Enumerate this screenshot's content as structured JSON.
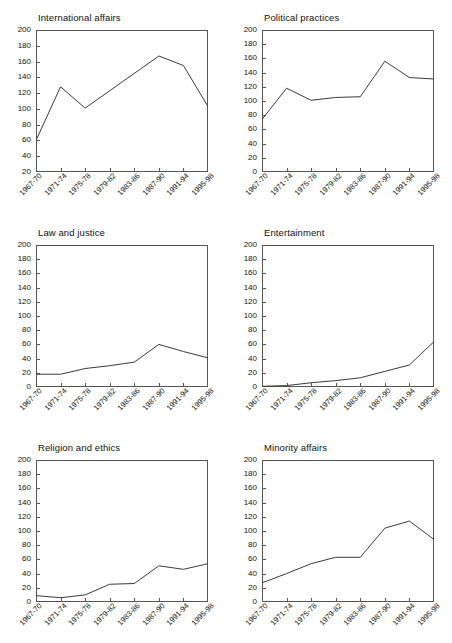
{
  "figure": {
    "panel_count": 6,
    "categories": [
      "1967-70",
      "1971-74",
      "1975-78",
      "1979-82",
      "1983-86",
      "1987-90",
      "1991-94",
      "1995-98"
    ],
    "line_color": "#3a3a3a",
    "axis_color": "#555555",
    "background": "#ffffff"
  },
  "chart_data": [
    {
      "type": "line",
      "title": "International affairs",
      "xlabel": "",
      "ylabel": "",
      "categories": [
        "1967-70",
        "1971-74",
        "1975-78",
        "1979-82",
        "1983-86",
        "1987-90",
        "1991-94",
        "1995-98"
      ],
      "values": [
        60,
        128,
        101,
        123,
        145,
        167,
        155,
        103
      ],
      "ylim": [
        20,
        200
      ],
      "yticks": [
        20,
        40,
        60,
        80,
        100,
        120,
        140,
        160,
        180,
        200
      ],
      "grid": false,
      "legend": "none"
    },
    {
      "type": "line",
      "title": "Political practices",
      "xlabel": "",
      "ylabel": "",
      "categories": [
        "1967-70",
        "1971-74",
        "1975-78",
        "1979-82",
        "1983-86",
        "1987-90",
        "1991-94",
        "1995-98"
      ],
      "values": [
        74,
        118,
        101,
        105,
        106,
        156,
        133,
        131
      ],
      "ylim": [
        0,
        200
      ],
      "yticks": [
        0,
        20,
        40,
        60,
        80,
        100,
        120,
        140,
        160,
        180,
        200
      ],
      "grid": false,
      "legend": "none"
    },
    {
      "type": "line",
      "title": "Law and justice",
      "xlabel": "",
      "ylabel": "",
      "categories": [
        "1967-70",
        "1971-74",
        "1975-78",
        "1979-82",
        "1983-86",
        "1987-90",
        "1991-94",
        "1995-98"
      ],
      "values": [
        18,
        18,
        26,
        30,
        35,
        60,
        50,
        41
      ],
      "ylim": [
        0,
        200
      ],
      "yticks": [
        0,
        20,
        40,
        60,
        80,
        100,
        120,
        140,
        160,
        180,
        200
      ],
      "grid": false,
      "legend": "none"
    },
    {
      "type": "line",
      "title": "Entertainment",
      "xlabel": "",
      "ylabel": "",
      "categories": [
        "1967-70",
        "1971-74",
        "1975-78",
        "1979-82",
        "1983-86",
        "1987-90",
        "1991-94",
        "1995-98"
      ],
      "values": [
        1,
        2,
        6,
        9,
        13,
        22,
        31,
        64
      ],
      "ylim": [
        0,
        200
      ],
      "yticks": [
        0,
        20,
        40,
        60,
        80,
        100,
        120,
        140,
        160,
        180,
        200
      ],
      "grid": false,
      "legend": "none"
    },
    {
      "type": "line",
      "title": "Religion and ethics",
      "xlabel": "",
      "ylabel": "",
      "categories": [
        "1967-70",
        "1971-74",
        "1975-78",
        "1979-82",
        "1983-86",
        "1987-90",
        "1991-94",
        "1995-98"
      ],
      "values": [
        9,
        6,
        10,
        25,
        26,
        51,
        46,
        54
      ],
      "ylim": [
        0,
        200
      ],
      "yticks": [
        0,
        20,
        40,
        60,
        80,
        100,
        120,
        140,
        160,
        180,
        200
      ],
      "grid": false,
      "legend": "none"
    },
    {
      "type": "line",
      "title": "Minority affairs",
      "xlabel": "",
      "ylabel": "",
      "categories": [
        "1967-70",
        "1971-74",
        "1975-78",
        "1979-82",
        "1983-86",
        "1987-90",
        "1991-94",
        "1995-98"
      ],
      "values": [
        27,
        40,
        54,
        63,
        63,
        104,
        114,
        88
      ],
      "ylim": [
        0,
        200
      ],
      "yticks": [
        0,
        20,
        40,
        60,
        80,
        100,
        120,
        140,
        160,
        180,
        200
      ],
      "grid": false,
      "legend": "none"
    }
  ]
}
